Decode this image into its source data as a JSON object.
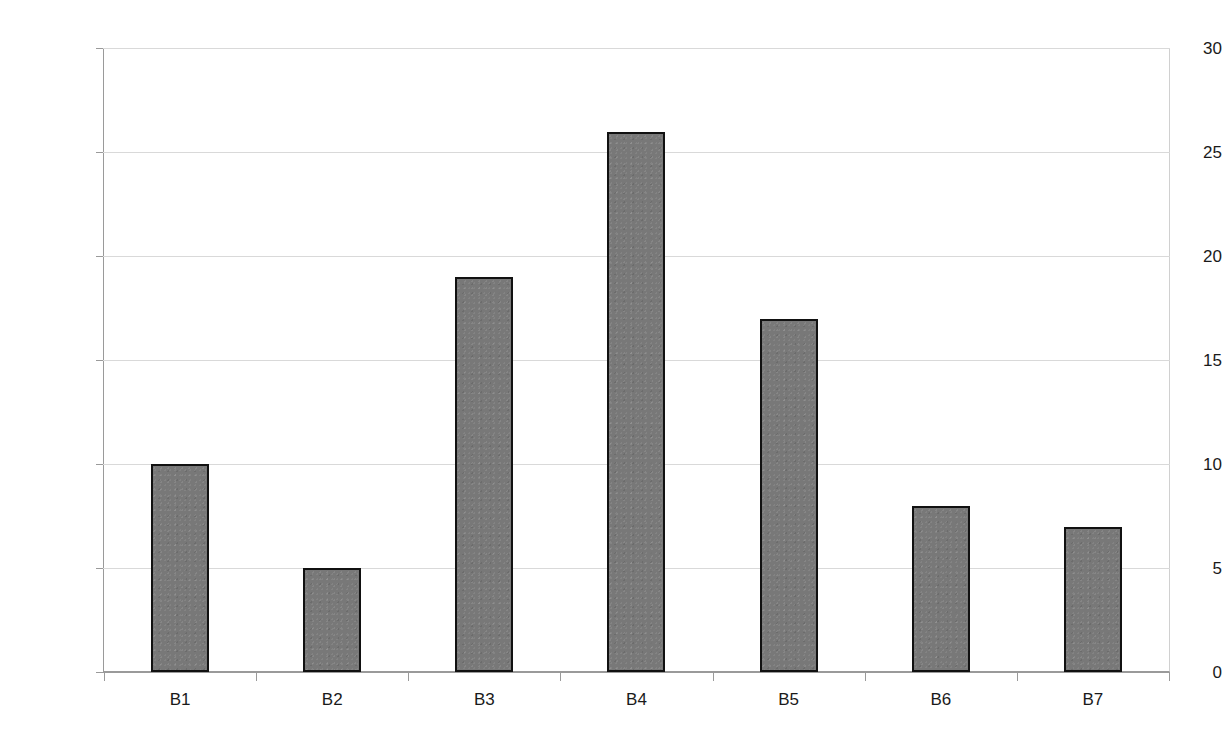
{
  "chart_data": {
    "type": "bar",
    "title": "",
    "subtitle": "",
    "xlabel": "",
    "ylabel": "",
    "categories": [
      "B1",
      "B2",
      "B3",
      "B4",
      "B5",
      "B6",
      "B7"
    ],
    "values": [
      10,
      5,
      19,
      26,
      17,
      8,
      7
    ],
    "ylim": [
      0,
      30
    ],
    "y_ticks": [
      0,
      5,
      10,
      15,
      20,
      25,
      30
    ],
    "y_tick_labels": [
      "0",
      "5",
      "10",
      "15",
      "20",
      "25",
      "30"
    ],
    "grid": true,
    "grid_axis": "y",
    "legend": false,
    "legend_position": "none",
    "annotations": [],
    "colors": {
      "bar_fill": "#787878",
      "bar_border": "#111111",
      "gridline": "#d9d9d9",
      "axis_line": "#9a9a9a",
      "plot_border": "#d0d0d0",
      "text": "#1a1a1a",
      "background": "#ffffff"
    }
  }
}
